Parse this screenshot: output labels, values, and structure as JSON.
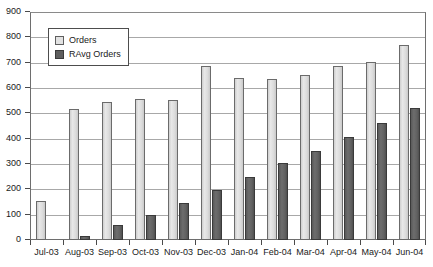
{
  "chart_data": {
    "type": "bar",
    "title": "",
    "subtitle": "",
    "xlabel": "",
    "ylabel": "",
    "ylim": [
      0,
      900
    ],
    "ytick_step": 100,
    "yticks": [
      0,
      100,
      200,
      300,
      400,
      500,
      600,
      700,
      800,
      900
    ],
    "ytick_labels": [
      "0",
      "100",
      "200",
      "300",
      "400",
      "500",
      "600",
      "700",
      "800",
      "900"
    ],
    "grid": true,
    "legend_position": "top-left",
    "categories": [
      "Jul-03",
      "Aug-03",
      "Sep-03",
      "Oct-03",
      "Nov-03",
      "Dec-03",
      "Jan-04",
      "Feb-04",
      "Mar-04",
      "Apr-04",
      "May-04",
      "Jun-04"
    ],
    "series": [
      {
        "name": "Orders",
        "color": "#d9d9d9",
        "values": [
          155,
          518,
          545,
          555,
          553,
          685,
          640,
          635,
          650,
          688,
          702,
          770
        ]
      },
      {
        "name": "RAvg Orders",
        "color": "#5e5e5e",
        "values": [
          0,
          15,
          58,
          100,
          148,
          196,
          250,
          305,
          352,
          405,
          462,
          522
        ]
      }
    ]
  },
  "legend": {
    "items": [
      {
        "label": "Orders",
        "swatch": "orders"
      },
      {
        "label": "RAvg Orders",
        "swatch": "ravg"
      }
    ]
  },
  "colors": {
    "series_orders": "#d9d9d9",
    "series_ravg": "#5e5e5e",
    "gridline": "#a8a8a8",
    "axis": "#6e6e6e",
    "text": "#1a1a1a",
    "background": "#ffffff"
  }
}
